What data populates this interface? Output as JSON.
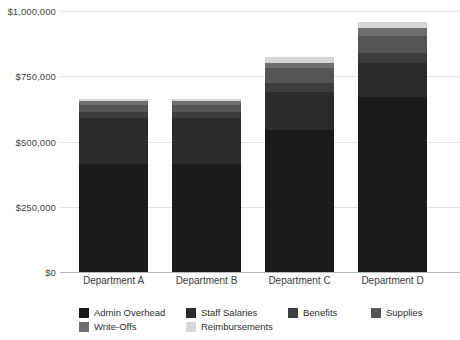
{
  "chart_data": {
    "type": "bar",
    "subtype": "stacked-bar",
    "title": "",
    "xlabel": "",
    "ylabel": "",
    "categories": [
      "Department A",
      "Department B",
      "Department C",
      "Department D"
    ],
    "ytick_labels": [
      "$0",
      "$250,000",
      "$500,000",
      "$750,000",
      "$1,000,000"
    ],
    "ytick_values": [
      0,
      250000,
      500000,
      750000,
      1000000
    ],
    "ylim": [
      0,
      1000000
    ],
    "grid": true,
    "legend_position": "bottom",
    "currency": "USD",
    "series": [
      {
        "name": "Admin Overhead",
        "color": "#1a1a1a",
        "values": [
          415000,
          415000,
          545000,
          670000
        ]
      },
      {
        "name": "Staff Salaries",
        "color": "#2b2b2b",
        "values": [
          175000,
          175000,
          145000,
          130000
        ]
      },
      {
        "name": "Benefits",
        "color": "#3d3d3d",
        "values": [
          25000,
          25000,
          35000,
          40000
        ]
      },
      {
        "name": "Supplies",
        "color": "#555555",
        "values": [
          24000,
          24000,
          58000,
          65000
        ]
      },
      {
        "name": "Write-Offs",
        "color": "#6e6e6e",
        "values": [
          18000,
          18000,
          18000,
          30000
        ]
      },
      {
        "name": "Reimbursements",
        "color": "#d6d6d6",
        "values": [
          6000,
          6000,
          23000,
          23000
        ]
      }
    ],
    "totals": [
      663000,
      663000,
      824000,
      958000
    ]
  },
  "legend": {
    "items": [
      {
        "label": "Admin Overhead",
        "color": "#1a1a1a"
      },
      {
        "label": "Staff Salaries",
        "color": "#2b2b2b"
      },
      {
        "label": "Benefits",
        "color": "#3d3d3d"
      },
      {
        "label": "Supplies",
        "color": "#555555"
      },
      {
        "label": "Write-Offs",
        "color": "#6e6e6e"
      },
      {
        "label": "Reimbursements",
        "color": "#d6d6d6"
      }
    ]
  },
  "style": {
    "background": "#ffffff",
    "gridline_color": "#e2e2e2",
    "axis_color": "#b9b9b9",
    "text_color": "#333333"
  }
}
